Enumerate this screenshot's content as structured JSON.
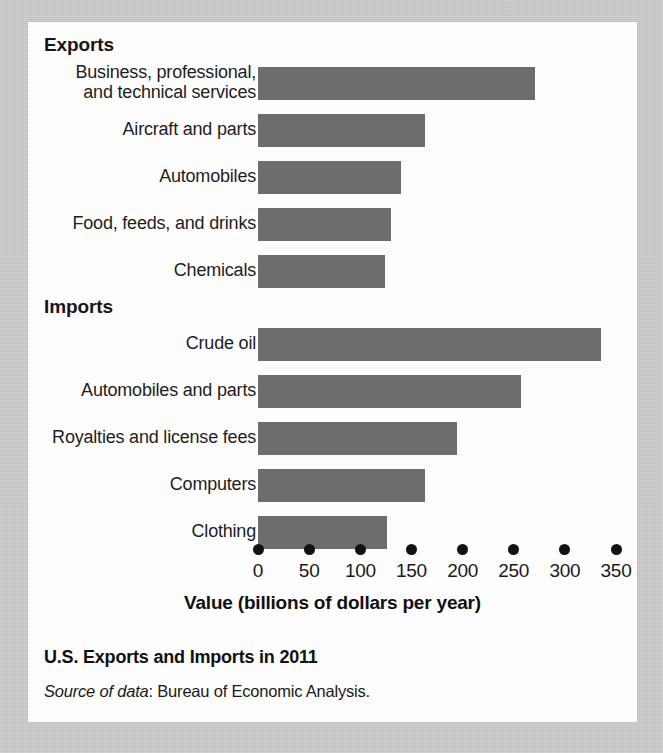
{
  "figure": {
    "title": "U.S. Exports and Imports in 2011",
    "source_prefix": "Source of data",
    "source_text": ": Bureau of Economic Analysis."
  },
  "groups": [
    {
      "key": "exports",
      "heading": "Exports"
    },
    {
      "key": "imports",
      "heading": "Imports"
    }
  ],
  "axis": {
    "title": "Value (billions of dollars per year)",
    "ticks": [
      "0",
      "50",
      "100",
      "150",
      "200",
      "250",
      "300",
      "350"
    ]
  },
  "bars": {
    "exports": [
      {
        "label_line1": "Business, professional,",
        "label_line2": "and technical services"
      },
      {
        "label_line1": "Aircraft and parts",
        "label_line2": ""
      },
      {
        "label_line1": "Automobiles",
        "label_line2": ""
      },
      {
        "label_line1": "Food, feeds, and drinks",
        "label_line2": ""
      },
      {
        "label_line1": "Chemicals",
        "label_line2": ""
      }
    ],
    "imports": [
      {
        "label_line1": "Crude oil",
        "label_line2": ""
      },
      {
        "label_line1": "Automobiles and parts",
        "label_line2": ""
      },
      {
        "label_line1": "Royalties and license fees",
        "label_line2": ""
      },
      {
        "label_line1": "Computers",
        "label_line2": ""
      },
      {
        "label_line1": "Clothing",
        "label_line2": ""
      }
    ]
  },
  "colors": {
    "bar": "#6c6d6f",
    "page_background": "#cbcbc9",
    "card_background": "#fdfdfd",
    "text": "#1a1a1a"
  },
  "chart_data": {
    "type": "bar",
    "orientation": "horizontal",
    "title": "U.S. Exports and Imports in 2011",
    "subtitle": "",
    "xlabel": "Value (billions of dollars per year)",
    "ylabel": "",
    "xlim": [
      0,
      350
    ],
    "xticks": [
      0,
      50,
      100,
      150,
      200,
      250,
      300,
      350
    ],
    "grid": false,
    "legend": false,
    "units": "billions of dollars per year",
    "source": "Source of data: Bureau of Economic Analysis.",
    "groups": [
      {
        "name": "Exports",
        "categories": [
          "Business, professional, and technical services",
          "Aircraft and parts",
          "Automobiles",
          "Food, feeds, and drinks",
          "Chemicals"
        ],
        "values": [
          271,
          163,
          140,
          130,
          124
        ]
      },
      {
        "name": "Imports",
        "categories": [
          "Crude oil",
          "Automobiles and parts",
          "Royalties and license fees",
          "Computers",
          "Clothing"
        ],
        "values": [
          335,
          257,
          195,
          163,
          126
        ]
      }
    ]
  }
}
